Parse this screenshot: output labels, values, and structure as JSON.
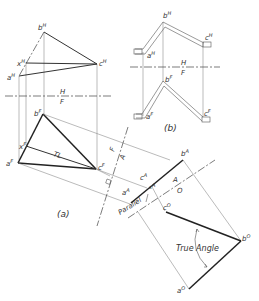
{
  "figure": {
    "panel_a": {
      "caption": "(a)",
      "top_view_labels": {
        "b": "b",
        "b_sup": "H",
        "x": "x",
        "x_sup": "H",
        "a": "a",
        "a_sup": "H",
        "c": "c",
        "c_sup": "H"
      },
      "front_view_labels": {
        "b": "b",
        "b_sup": "F",
        "x": "x",
        "x_sup": "F",
        "a": "a",
        "a_sup": "F",
        "c": "c",
        "c_sup": "F"
      },
      "fold_line_HF": {
        "upper": "H",
        "lower": "F"
      },
      "true_length_label": "TL",
      "fold_line_FA": {
        "left": "F",
        "right": "A"
      },
      "aux_view_labels": {
        "b": "b",
        "b_sup": "A",
        "c": "c",
        "c_sup": "A",
        "a": "a",
        "a_sup": "A",
        "x": "x",
        "x_sup": "A"
      },
      "fold_line_AO": {
        "upper": "A",
        "lower": "O"
      },
      "parallel_label": "Parallel",
      "oblique_view_labels": {
        "c": "c",
        "c_sup": "O",
        "b": "b",
        "b_sup": "O",
        "a": "a",
        "a_sup": "O"
      },
      "true_angle_label": "True Angle"
    },
    "panel_b": {
      "caption": "(b)",
      "top_labels": {
        "b": "b",
        "b_sup": "H",
        "a": "a",
        "a_sup": "H",
        "c": "c",
        "c_sup": "H"
      },
      "fold_line_HF": {
        "upper": "H",
        "lower": "F"
      },
      "front_labels": {
        "b": "b",
        "b_sup": "F",
        "a": "a",
        "a_sup": "F",
        "c": "c",
        "c_sup": "F"
      }
    }
  }
}
